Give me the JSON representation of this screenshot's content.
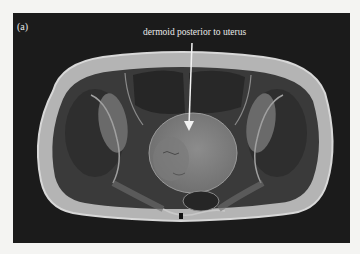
{
  "figure": {
    "panel_label": "(a)",
    "annotation": "dermoid posterior to uterus",
    "modality": "axial pelvic MRI",
    "colors": {
      "background": "#1b1b1b",
      "page": "#f4f4f2",
      "arrow": "#f2f2f2",
      "text": "#eaeaea"
    }
  }
}
